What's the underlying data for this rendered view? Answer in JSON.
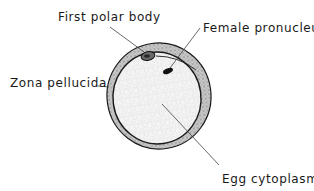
{
  "figure": {
    "labels": {
      "first_polar_body": "First polar body",
      "female_pronucleus": "Female pronucleus",
      "zona_pellucida": "Zona pellucida",
      "egg_cytoplasm": "Egg cytoplasm"
    },
    "colors": {
      "line": "#1a1a1a",
      "zona_fill": "#bdbdbd",
      "cytoplasm_fill": "#f2f2f2",
      "pronucleus_fill": "#111111",
      "background": "#ffffff"
    }
  }
}
